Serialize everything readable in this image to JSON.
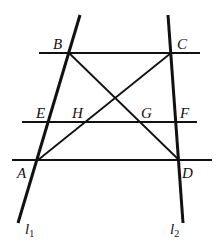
{
  "diagram": {
    "type": "geometry",
    "colors": {
      "stroke": "#111111",
      "background": "#ffffff"
    },
    "points": {
      "A": {
        "label": "A",
        "x": 38,
        "y": 160
      },
      "B": {
        "label": "B",
        "x": 69,
        "y": 53
      },
      "C": {
        "label": "C",
        "x": 171,
        "y": 53
      },
      "D": {
        "label": "D",
        "x": 179,
        "y": 160
      },
      "E": {
        "label": "E",
        "x": 49,
        "y": 122
      },
      "F": {
        "label": "F",
        "x": 176,
        "y": 122
      },
      "G": {
        "label": "G",
        "x": 140,
        "y": 122
      },
      "H": {
        "label": "H",
        "x": 85,
        "y": 122
      }
    },
    "lines": {
      "l1": {
        "label": "l",
        "subscript": "1"
      },
      "l2": {
        "label": "l",
        "subscript": "2"
      }
    },
    "segments": [
      "BC",
      "EF",
      "AD",
      "AC",
      "BD"
    ]
  }
}
